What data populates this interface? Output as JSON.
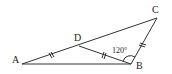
{
  "diagram": {
    "type": "geometry-triangle",
    "points": {
      "A": {
        "label": "A",
        "x": 22,
        "y": 64,
        "label_x": 12,
        "label_y": 63
      },
      "B": {
        "label": "B",
        "x": 131,
        "y": 64,
        "label_x": 136,
        "label_y": 69
      },
      "C": {
        "label": "C",
        "x": 157,
        "y": 18,
        "label_x": 152,
        "label_y": 13
      },
      "D": {
        "label": "D",
        "x": 79,
        "y": 46,
        "label_x": 74,
        "label_y": 41
      }
    },
    "segments": [
      "AB",
      "AC",
      "BC",
      "DB"
    ],
    "equal_marks": [
      "AD",
      "DB",
      "BC"
    ],
    "angle": {
      "label": "120°",
      "vertex": "B",
      "between": [
        "D",
        "C"
      ],
      "label_x": 112,
      "label_y": 52
    },
    "colors": {
      "stroke": "#333333",
      "text": "#222222",
      "background": "#ffffff"
    }
  }
}
